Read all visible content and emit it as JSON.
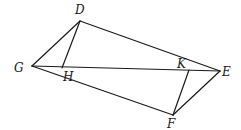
{
  "diagram": {
    "type": "geometry",
    "colors": {
      "stroke": "#1a1a1a",
      "background": "#ffffff"
    },
    "points": {
      "G": {
        "label": "G",
        "x": 32,
        "y": 66,
        "label_x": 14,
        "label_y": 72
      },
      "D": {
        "label": "D",
        "x": 80,
        "y": 21,
        "label_x": 75,
        "label_y": 14
      },
      "H": {
        "label": "H",
        "x": 62,
        "y": 68,
        "label_x": 63,
        "label_y": 81
      },
      "K": {
        "label": "K",
        "x": 189,
        "y": 70,
        "label_x": 177,
        "label_y": 68
      },
      "E": {
        "label": "E",
        "x": 220,
        "y": 71,
        "label_x": 222,
        "label_y": 76
      },
      "F": {
        "label": "F",
        "x": 173,
        "y": 115,
        "label_x": 167,
        "label_y": 128
      }
    },
    "segments": [
      [
        "G",
        "D"
      ],
      [
        "D",
        "E"
      ],
      [
        "G",
        "E"
      ],
      [
        "G",
        "F"
      ],
      [
        "F",
        "E"
      ],
      [
        "D",
        "H"
      ],
      [
        "K",
        "F"
      ]
    ],
    "labels": [
      "D",
      "G",
      "H",
      "K",
      "E",
      "F"
    ]
  }
}
